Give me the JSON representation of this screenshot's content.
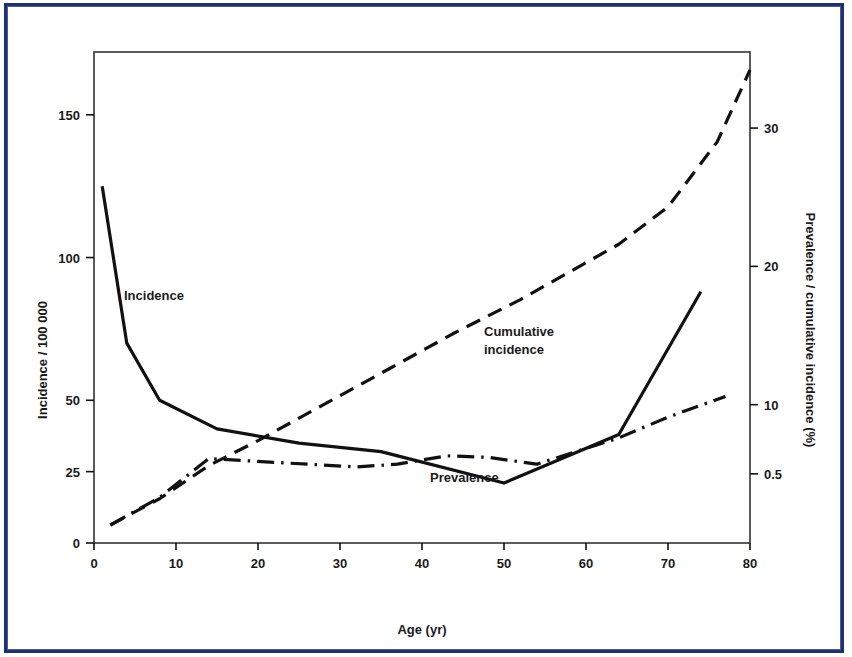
{
  "figure": {
    "frame_color": "#1f2f70",
    "background_color": "#ffffff",
    "ink_color": "#111111"
  },
  "chart_data": {
    "type": "line",
    "title": "",
    "subtitle": "",
    "xlabel": "Age (yr)",
    "ylabel": "Incidence / 100 000",
    "y2label": "Prevalence / cumulative incidence (%)",
    "xlim": [
      0,
      80
    ],
    "ylim": [
      0,
      172
    ],
    "y2lim": [
      0,
      35.5
    ],
    "grid": false,
    "legend": "inline-annotations",
    "xticks": [
      0,
      10,
      20,
      30,
      40,
      50,
      60,
      70,
      80
    ],
    "xtick_labels": [
      "0",
      "10",
      "20",
      "30",
      "40",
      "50",
      "60",
      "70",
      "80"
    ],
    "yticks": [
      0,
      25,
      50,
      100,
      150
    ],
    "ytick_labels": [
      "0",
      "25",
      "50",
      "100",
      "150"
    ],
    "y2ticks": [
      5,
      10,
      20,
      30
    ],
    "y2tick_labels": [
      "0.5",
      "10",
      "20",
      "30"
    ],
    "series": [
      {
        "name": "Incidence",
        "axis": "left",
        "style": "solid",
        "label_text": "Incidence",
        "label_x": 11,
        "label_y": 106,
        "x": [
          1,
          4,
          8,
          15,
          25,
          35,
          50,
          64,
          74
        ],
        "values": [
          125,
          70,
          50,
          40,
          35,
          32,
          21,
          38,
          88
        ]
      },
      {
        "name": "Cumulative incidence",
        "axis": "right",
        "style": "dashed",
        "label_text": "Cumulative\nincidence",
        "label_line1": "Cumulative",
        "label_line2": "incidence",
        "label_x": 48,
        "label_y": 18.2,
        "x": [
          2,
          8,
          14,
          20,
          28,
          36,
          44,
          52,
          58,
          64,
          70,
          76,
          80
        ],
        "values": [
          1.3,
          3.2,
          5.6,
          7.4,
          10.0,
          12.6,
          15.2,
          17.6,
          19.6,
          21.6,
          24.3,
          29.0,
          34.2
        ]
      },
      {
        "name": "Prevalence",
        "axis": "right",
        "style": "dash-dot",
        "label_text": "Prevalence",
        "label_x": 41,
        "label_y": 8.6,
        "x": [
          2,
          8,
          14,
          23,
          32,
          37,
          43,
          48,
          54,
          64,
          70,
          77
        ],
        "values": [
          1.3,
          3.3,
          6.1,
          5.8,
          5.5,
          5.7,
          6.3,
          6.2,
          5.7,
          7.6,
          9.1,
          10.6
        ]
      }
    ]
  },
  "annotations": {
    "incidence_label": "Incidence",
    "cumulative_label_line1": "Cumulative",
    "cumulative_label_line2": "incidence",
    "prevalence_label": "Prevalence"
  }
}
